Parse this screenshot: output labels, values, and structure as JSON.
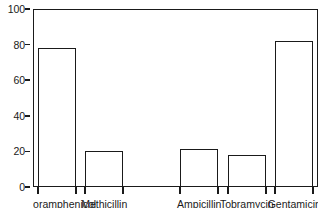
{
  "chart_data": {
    "type": "bar",
    "title": "",
    "subtitle": "",
    "xlabel": "",
    "ylabel": "",
    "ylim": [
      0,
      100
    ],
    "yticks": [
      0,
      20,
      40,
      60,
      80,
      100
    ],
    "ytick_labels": [
      "0",
      "20",
      "40",
      "60",
      "80",
      "100"
    ],
    "grid": false,
    "legend": null,
    "bar_style": {
      "fill": "#ffffff",
      "edge_color": "#1a1a1a",
      "edge_width": 1.6
    },
    "categories": [
      "Chloramphenicol",
      "Methicillin",
      "Ampicillin",
      "Tobramycin",
      "Gentamicin"
    ],
    "values": [
      78,
      20.5,
      21.5,
      18,
      82
    ],
    "series": [
      {
        "name": "",
        "values": [
          78,
          20.5,
          21.5,
          18,
          82
        ]
      }
    ]
  },
  "axis": {
    "y_tick_labels": [
      "100",
      "80",
      "60",
      "40",
      "20",
      "0"
    ]
  },
  "colors": {
    "ink": "#1a1a1a",
    "background": "#ffffff"
  }
}
